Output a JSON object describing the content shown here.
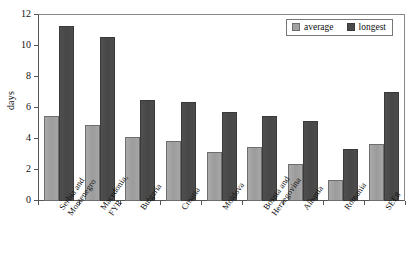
{
  "chart_data": {
    "type": "bar",
    "title": "",
    "xlabel": "",
    "ylabel": "days",
    "ylim": [
      0,
      12
    ],
    "yticks": [
      0,
      2,
      4,
      6,
      8,
      10,
      12
    ],
    "grid": false,
    "legend_position": "top-right",
    "categories": [
      "Serbia and\nMontenegro",
      "Macedonia,\nFYR",
      "Bulgaria",
      "Croatia",
      "Moldova",
      "Bosnia and\nHerzegovina",
      "Albania",
      "Romania",
      "SEE8"
    ],
    "series": [
      {
        "name": "average",
        "color": "#a2a2a2",
        "values": [
          5.5,
          4.9,
          4.15,
          3.85,
          3.15,
          3.5,
          2.4,
          1.35,
          3.7
        ]
      },
      {
        "name": "longest",
        "color": "#4a4a4a",
        "values": [
          11.3,
          10.6,
          6.5,
          6.4,
          5.75,
          5.5,
          5.15,
          3.35,
          7.05
        ]
      }
    ]
  },
  "axis": {
    "y_title": "days",
    "tick_labels": [
      "12",
      "10",
      "8",
      "6",
      "4",
      "2",
      "0"
    ]
  },
  "legend": {
    "entries": [
      {
        "label": "average"
      },
      {
        "label": "longest"
      }
    ]
  }
}
